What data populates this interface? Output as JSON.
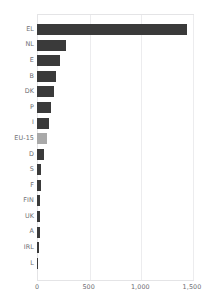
{
  "chart_data": {
    "type": "bar",
    "orientation": "horizontal",
    "title": "",
    "xlabel": "",
    "ylabel": "",
    "categories": [
      "EL",
      "NL",
      "E",
      "B",
      "DK",
      "P",
      "I",
      "EU-15",
      "D",
      "S",
      "F",
      "FIN",
      "UK",
      "A",
      "IRL",
      "L"
    ],
    "values": [
      1450,
      280,
      225,
      185,
      165,
      140,
      115,
      95,
      70,
      40,
      38,
      33,
      30,
      25,
      20,
      5
    ],
    "highlight_category": "EU-15",
    "xlim": [
      0,
      1500
    ],
    "xticks": [
      0,
      500,
      1000,
      1500
    ],
    "xticklabels": [
      "0",
      "500",
      "1,000",
      "1,500"
    ],
    "grid": "vertical",
    "legend": "none",
    "bar_color": "#3a3a3a",
    "highlight_color": "#a9a9a9",
    "gridline_color": "#ececee",
    "axis_border_color": "#e4e4e6",
    "label_color": "#6d6d72",
    "background_color": "#ffffff"
  }
}
